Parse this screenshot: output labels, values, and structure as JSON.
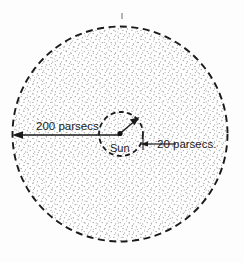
{
  "figure": {
    "background_color": "#fdfdfd",
    "ink_color": "#1a1a1a",
    "stipple_color": "#9a9a9a"
  },
  "outer_region": {
    "name": "200 parsec sphere",
    "boundary_style": "dashed",
    "fill": "stippled",
    "center_x": 120,
    "center_y": 134,
    "radius": 108
  },
  "inner_region": {
    "name": "20 parsec sphere",
    "boundary_style": "dashed",
    "center_x": 121,
    "center_y": 134,
    "radius": 22
  },
  "labels": {
    "outer_radius": "200 parsecs",
    "inner_radius": "20 parsecs.",
    "center_body": "Sun"
  },
  "arrows": {
    "outer": {
      "label": "200 parsecs",
      "from_x": 120,
      "from_y": 135,
      "to_x": 13,
      "to_y": 135,
      "head_at": "left"
    },
    "inner": {
      "label": "20 parsecs.",
      "from_x": 120,
      "from_y": 134,
      "to_x": 138,
      "to_y": 119,
      "head_at": "upper-right"
    },
    "leader": {
      "from_x": 176,
      "from_y": 144,
      "to_x": 140,
      "to_y": 144,
      "head_at": "left"
    }
  },
  "tick_mark": {
    "x": 122,
    "y_top": 13,
    "y_bottom": 19
  }
}
